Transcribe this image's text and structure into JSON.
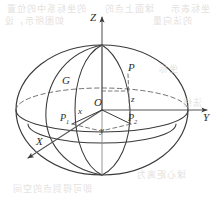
{
  "figure": {
    "stroke_color": "#3a3a3a",
    "dash_color": "#6b6b6b",
    "label_color": "#2c2c2c",
    "background": "#ffffff"
  },
  "axes": [
    {
      "name": "z-axis",
      "label": "Z",
      "direction": "up"
    },
    {
      "name": "y-axis",
      "label": "Y",
      "direction": "right"
    },
    {
      "name": "x-axis",
      "label": "X",
      "direction": "down-left"
    }
  ],
  "points": [
    {
      "name": "origin",
      "label": "O",
      "sub": ""
    },
    {
      "name": "point-p",
      "label": "P",
      "sub": ""
    },
    {
      "name": "point-p1",
      "label": "P",
      "sub": "1"
    },
    {
      "name": "point-p2",
      "label": "P",
      "sub": "2"
    },
    {
      "name": "point-g",
      "label": "G",
      "sub": ""
    }
  ],
  "components": [
    {
      "name": "x-component",
      "label": "x"
    },
    {
      "name": "y-component",
      "label": "y"
    },
    {
      "name": "z-component",
      "label": "z"
    }
  ],
  "labels": {
    "axis_z": "Z",
    "axis_y": "Y",
    "axis_x": "X",
    "origin": "O",
    "p": "P",
    "p1": "P",
    "p1_sub": "1",
    "p2": "P",
    "p2_sub": "2",
    "g": "G",
    "comp_x": "x",
    "comp_y": "y",
    "comp_z": "z"
  },
  "bleedthrough": [
    {
      "text": "的坐标系中的位置",
      "x": 6,
      "y": 2,
      "size": 9
    },
    {
      "text": "球面上点的",
      "x": 104,
      "y": 2,
      "size": 9
    },
    {
      "text": "坐标表示",
      "x": 170,
      "y": 2,
      "size": 9
    },
    {
      "text": "如图所示，设",
      "x": 4,
      "y": 14,
      "size": 9
    },
    {
      "text": "的法向量",
      "x": 152,
      "y": 14,
      "size": 9
    },
    {
      "text": "坐标",
      "x": 158,
      "y": 62,
      "size": 9
    },
    {
      "text": "法线",
      "x": 182,
      "y": 96,
      "size": 9
    },
    {
      "text": "球心距离为",
      "x": 136,
      "y": 168,
      "size": 9
    },
    {
      "text": "即可得到点的空间",
      "x": 12,
      "y": 182,
      "size": 9
    }
  ]
}
